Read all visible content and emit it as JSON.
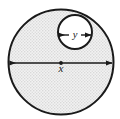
{
  "figure": {
    "name": "circle-with-inner-circle-diagram",
    "background_color": "#ffffff",
    "width": 120,
    "height": 119,
    "outline_color": "#1a1a1a",
    "fill_color": "#e9e9e9",
    "stipple_color": "#d6d6d6"
  },
  "shapes": {
    "large_circle": {
      "label": "large-circle",
      "cx": 61,
      "cy": 62,
      "r": 52.5,
      "fill": "stipple",
      "stroke_width": 2
    },
    "small_circle": {
      "label": "small-circle",
      "cx": 75,
      "cy": 32,
      "r": 17,
      "fill": "#ffffff",
      "stroke_width": 2
    }
  },
  "dimensions": [
    {
      "id": "x",
      "label": "x",
      "measures": "large-circle-diameter",
      "orientation": "horizontal",
      "y": 63,
      "x1": 10,
      "x2": 112,
      "label_x": 61,
      "label_y": 72,
      "has_center_dot": true,
      "center_dot_x": 61,
      "center_dot_y": 63
    },
    {
      "id": "y",
      "label": "y",
      "measures": "small-circle-diameter",
      "orientation": "horizontal",
      "y": 35,
      "x1": 59,
      "x2": 91,
      "label_x": 75,
      "label_y": 38,
      "has_center_dot": false
    }
  ],
  "labels": {
    "x_label": "x",
    "y_label": "y"
  }
}
